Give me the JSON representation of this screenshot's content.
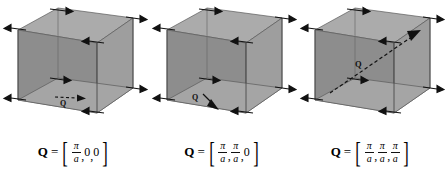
{
  "figure": {
    "type": "diagram",
    "background_color": "#ffffff",
    "cube_face_colors": {
      "top": "#a8a8a8",
      "left": "#8f8f8f",
      "right": "#9c9c9c",
      "bottom": "#a2a2a2",
      "edge": "#4a4a4a",
      "arrow": "#111111"
    },
    "panels": [
      {
        "id": "panel-1",
        "q_label": "Q",
        "q_arrow": "horizontal-right-dashed",
        "displacement_pattern": "alternating-horizontal",
        "formula": {
          "lhs": "Q",
          "eq": "=",
          "bracket_open": "[",
          "bracket_close": "]",
          "components": [
            {
              "kind": "fraction",
              "num": "π",
              "den": "a"
            },
            {
              "kind": "scalar",
              "value": "0"
            },
            {
              "kind": "scalar",
              "value": "0"
            }
          ],
          "plain": "Q = [π/a, 0, 0]"
        }
      },
      {
        "id": "panel-2",
        "q_label": "Q",
        "q_arrow": "diagonal-down-right-dashed",
        "displacement_pattern": "alternating-horizontal",
        "formula": {
          "lhs": "Q",
          "eq": "=",
          "bracket_open": "[",
          "bracket_close": "]",
          "components": [
            {
              "kind": "fraction",
              "num": "π",
              "den": "a"
            },
            {
              "kind": "fraction",
              "num": "π",
              "den": "a"
            },
            {
              "kind": "scalar",
              "value": "0"
            }
          ],
          "plain": "Q = [π/a, π/a, 0]"
        }
      },
      {
        "id": "panel-3",
        "q_label": "Q",
        "q_arrow": "body-diagonal-up-right-dashed",
        "displacement_pattern": "alternating-horizontal",
        "formula": {
          "lhs": "Q",
          "eq": "=",
          "bracket_open": "[",
          "bracket_close": "]",
          "components": [
            {
              "kind": "fraction",
              "num": "π",
              "den": "a"
            },
            {
              "kind": "fraction",
              "num": "π",
              "den": "a"
            },
            {
              "kind": "fraction",
              "num": "π",
              "den": "a"
            }
          ],
          "plain": "Q = [π/a, π/a, π/a]"
        }
      }
    ]
  }
}
